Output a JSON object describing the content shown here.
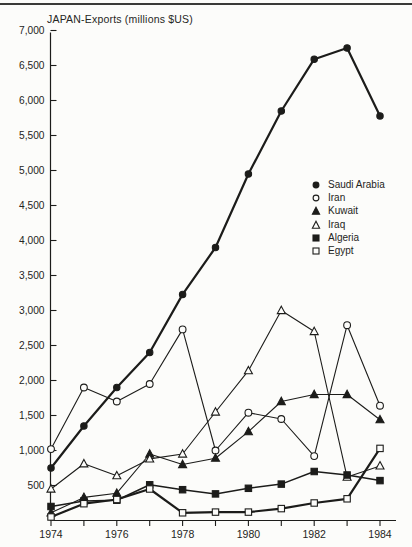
{
  "chart_data": {
    "type": "line",
    "title": "JAPAN-Exports (millions $US)",
    "x": [
      1974,
      1975,
      1976,
      1977,
      1978,
      1979,
      1980,
      1981,
      1982,
      1983,
      1984
    ],
    "x_labeled_ticks": [
      "1974",
      "1976",
      "1978",
      "1980",
      "1982",
      "1984"
    ],
    "xlabel": "",
    "ylabel": "",
    "ylim": [
      0,
      7000
    ],
    "y_ticks": [
      {
        "value": 500,
        "label": "500"
      },
      {
        "value": 1000,
        "label": "1,000"
      },
      {
        "value": 1500,
        "label": "1,500"
      },
      {
        "value": 2000,
        "label": "2,000"
      },
      {
        "value": 2500,
        "label": "2,500"
      },
      {
        "value": 3000,
        "label": "3,000"
      },
      {
        "value": 3500,
        "label": "3,500"
      },
      {
        "value": 4000,
        "label": "4,000"
      },
      {
        "value": 4500,
        "label": "4,500"
      },
      {
        "value": 5000,
        "label": "5,000"
      },
      {
        "value": 5500,
        "label": "5,500"
      },
      {
        "value": 6000,
        "label": "6,000"
      },
      {
        "value": 6500,
        "label": "6,500"
      },
      {
        "value": 7000,
        "label": "7,000"
      }
    ],
    "grid": false,
    "legend_position": "middle-right",
    "ink_color": "#1c1c1a",
    "background_color": "#fcfcfa",
    "series": [
      {
        "name": "Saudi Arabia",
        "marker": "filled-circle",
        "emphasis": "bold",
        "values": [
          750,
          1350,
          1900,
          2400,
          3230,
          3900,
          4950,
          5850,
          6590,
          6750,
          5780
        ]
      },
      {
        "name": "Iran",
        "marker": "open-circle",
        "emphasis": "normal",
        "values": [
          1020,
          1900,
          1700,
          1950,
          2730,
          1000,
          1540,
          1450,
          920,
          2790,
          1640
        ]
      },
      {
        "name": "Kuwait",
        "marker": "filled-triangle",
        "emphasis": "normal",
        "values": [
          110,
          330,
          390,
          950,
          800,
          890,
          1270,
          1700,
          1800,
          1800,
          1440
        ]
      },
      {
        "name": "Iraq",
        "marker": "open-triangle",
        "emphasis": "normal",
        "values": [
          450,
          810,
          640,
          880,
          950,
          1550,
          2140,
          3000,
          2700,
          620,
          780
        ]
      },
      {
        "name": "Algeria",
        "marker": "filled-square",
        "emphasis": "medium",
        "values": [
          200,
          280,
          290,
          510,
          440,
          380,
          460,
          520,
          700,
          650,
          570
        ]
      },
      {
        "name": "Egypt",
        "marker": "open-square",
        "emphasis": "bold",
        "values": [
          50,
          240,
          300,
          450,
          110,
          120,
          120,
          170,
          250,
          310,
          1030
        ]
      }
    ]
  }
}
